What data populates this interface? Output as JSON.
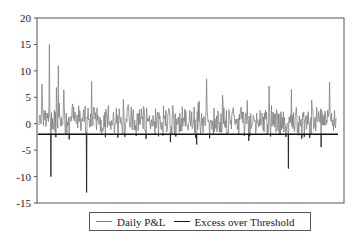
{
  "chart_data": {
    "type": "line",
    "title": "",
    "xlabel": "",
    "ylabel": "",
    "ylim": [
      -15,
      20
    ],
    "yticks": [
      20,
      15,
      10,
      5,
      0,
      -5,
      -10,
      -15
    ],
    "grid": false,
    "legend_position": "bottom",
    "threshold": -2,
    "series": [
      {
        "name": "Daily P&L",
        "color": "#808080",
        "style": "thin line",
        "description": "Noisy daily P&L series oscillating mostly between about -5 and +5, with spikes up to ~15, ~11, ~8.5 and dips down to ~-13",
        "notable_points": [
          {
            "x_frac": 0.01,
            "y": 7.5
          },
          {
            "x_frac": 0.035,
            "y": 15
          },
          {
            "x_frac": 0.065,
            "y": 11
          },
          {
            "x_frac": 0.16,
            "y": -13
          },
          {
            "x_frac": 0.04,
            "y": -10
          },
          {
            "x_frac": 0.565,
            "y": 8.5
          },
          {
            "x_frac": 0.85,
            "y": 6.5
          },
          {
            "x_frac": 0.84,
            "y": -8.5
          }
        ]
      },
      {
        "name": "Excess over Threshold",
        "color": "#111111",
        "style": "thick horizontal line at threshold with downward excess spikes",
        "value": -2
      }
    ]
  },
  "legend": {
    "items": [
      {
        "label": "Daily P&L",
        "color": "#808080"
      },
      {
        "label": "Excess over Threshold",
        "color": "#111111"
      }
    ]
  }
}
